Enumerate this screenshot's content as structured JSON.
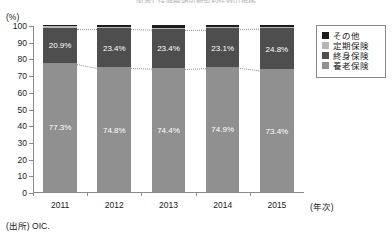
{
  "title": "図表1 保険種類別新契約件数の推移",
  "y_axis": {
    "unit_label": "(%)",
    "ticks": [
      "100",
      "90",
      "80",
      "70",
      "60",
      "50",
      "40",
      "30",
      "20",
      "10",
      "0"
    ]
  },
  "x_axis": {
    "axis_title": "(年次)",
    "ticks": [
      "2011",
      "2012",
      "2013",
      "2014",
      "2015"
    ]
  },
  "legend": {
    "items": [
      {
        "label": "その他",
        "color": "#1c1c1c"
      },
      {
        "label": "定期保険",
        "color": "#b5b5b5"
      },
      {
        "label": "終身保険",
        "color": "#4e4e4e"
      },
      {
        "label": "養老保険",
        "color": "#909090"
      }
    ]
  },
  "source": "(出所) OIC.",
  "chart_data": {
    "type": "bar",
    "stacked": true,
    "normalized_percent": true,
    "title": "図表1 保険種類別新契約件数の推移",
    "xlabel": "(年次)",
    "ylabel": "(%)",
    "ylim": [
      0,
      100
    ],
    "ytick_step": 10,
    "grid": false,
    "legend_position": "right",
    "categories": [
      "2011",
      "2012",
      "2013",
      "2014",
      "2015"
    ],
    "series": [
      {
        "name": "養老保険",
        "color": "#909090",
        "values": [
          77.3,
          74.8,
          74.4,
          74.9,
          73.4
        ],
        "labels": [
          "77.3%",
          "74.8%",
          "74.4%",
          "74.9%",
          "73.4%"
        ]
      },
      {
        "name": "終身保険",
        "color": "#4e4e4e",
        "values": [
          20.9,
          23.4,
          23.4,
          23.1,
          24.8
        ],
        "labels": [
          "20.9%",
          "23.4%",
          "23.4%",
          "23.1%",
          "24.8%"
        ]
      },
      {
        "name": "定期保険",
        "color": "#b5b5b5",
        "values": [
          1.0,
          0.6,
          0.7,
          0.6,
          0.5
        ],
        "labels": [
          "",
          "",
          "",
          "",
          ""
        ]
      },
      {
        "name": "その他",
        "color": "#1c1c1c",
        "values": [
          0.8,
          1.2,
          1.5,
          1.4,
          1.3
        ],
        "labels": [
          "",
          "",
          "",
          "",
          ""
        ]
      }
    ],
    "annotations": [
      "dotted connector lines link the 養老保険/終身保険 boundary across adjacent bars",
      "dotted connector lines link the 終身保険 top boundary across adjacent bars"
    ]
  }
}
